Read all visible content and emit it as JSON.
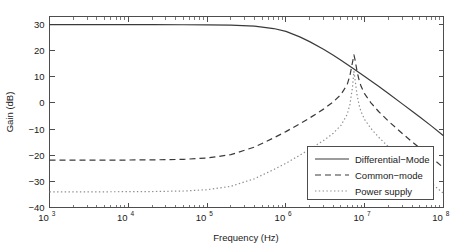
{
  "chart_data": {
    "type": "line",
    "title": "",
    "xlabel": "Frequency (Hz)",
    "ylabel": "Gain (dB)",
    "xscale": "log",
    "yscale": "linear",
    "xlim": [
      1000,
      100000000
    ],
    "ylim": [
      -40,
      33
    ],
    "grid": false,
    "legend_position": "center-right",
    "xticks": [
      {
        "value": 1000,
        "label": "10",
        "exp": "3"
      },
      {
        "value": 10000,
        "label": "10",
        "exp": "4"
      },
      {
        "value": 100000,
        "label": "10",
        "exp": "5"
      },
      {
        "value": 1000000,
        "label": "10",
        "exp": "6"
      },
      {
        "value": 10000000,
        "label": "10",
        "exp": "7"
      },
      {
        "value": 100000000,
        "label": "10",
        "exp": "8"
      }
    ],
    "yticks": [
      {
        "value": 30,
        "label": "30"
      },
      {
        "value": 20,
        "label": "20"
      },
      {
        "value": 10,
        "label": "10"
      },
      {
        "value": 0,
        "label": "0"
      },
      {
        "value": -10,
        "label": "−10"
      },
      {
        "value": -20,
        "label": "−20"
      },
      {
        "value": -30,
        "label": "−30"
      },
      {
        "value": -40,
        "label": "−40"
      }
    ],
    "series": [
      {
        "name": "Differential−Mode",
        "style": "solid",
        "color": "#3a3a3a",
        "points": [
          [
            1000,
            29.9
          ],
          [
            2000,
            29.9
          ],
          [
            5000,
            29.9
          ],
          [
            10000,
            29.9
          ],
          [
            20000,
            29.9
          ],
          [
            50000,
            29.85
          ],
          [
            100000,
            29.8
          ],
          [
            200000,
            29.7
          ],
          [
            400000,
            29.3
          ],
          [
            700000,
            28.4
          ],
          [
            1000000,
            27.3
          ],
          [
            1500000,
            25.2
          ],
          [
            2000000,
            23.4
          ],
          [
            3000000,
            20.5
          ],
          [
            4000000,
            18.2
          ],
          [
            5000000,
            16.3
          ],
          [
            7000000,
            13.3
          ],
          [
            10000000,
            10.1
          ],
          [
            15000000,
            6.3
          ],
          [
            20000000,
            3.6
          ],
          [
            30000000,
            -0.4
          ],
          [
            40000000,
            -3.2
          ],
          [
            50000000,
            -5.4
          ],
          [
            70000000,
            -8.8
          ],
          [
            100000000,
            -12.6
          ]
        ]
      },
      {
        "name": "Common−mode",
        "style": "dashed",
        "color": "#3a3a3a",
        "points": [
          [
            1000,
            -21.9
          ],
          [
            2000,
            -21.9
          ],
          [
            5000,
            -21.9
          ],
          [
            10000,
            -21.85
          ],
          [
            20000,
            -21.8
          ],
          [
            50000,
            -21.6
          ],
          [
            100000,
            -21.1
          ],
          [
            200000,
            -19.8
          ],
          [
            400000,
            -16.9
          ],
          [
            700000,
            -13.4
          ],
          [
            1000000,
            -11.0
          ],
          [
            1500000,
            -8.0
          ],
          [
            2000000,
            -5.8
          ],
          [
            3000000,
            -2.4
          ],
          [
            4000000,
            0.4
          ],
          [
            5000000,
            3.2
          ],
          [
            6000000,
            7.0
          ],
          [
            6500000,
            10.5
          ],
          [
            7000000,
            15.5
          ],
          [
            7300000,
            18.3
          ],
          [
            7600000,
            16.0
          ],
          [
            8000000,
            12.0
          ],
          [
            8500000,
            8.6
          ],
          [
            9000000,
            6.3
          ],
          [
            10000000,
            3.4
          ],
          [
            12000000,
            0.0
          ],
          [
            15000000,
            -3.3
          ],
          [
            20000000,
            -7.0
          ],
          [
            30000000,
            -11.7
          ],
          [
            40000000,
            -14.9
          ],
          [
            50000000,
            -17.3
          ],
          [
            70000000,
            -20.9
          ],
          [
            100000000,
            -24.8
          ]
        ]
      },
      {
        "name": "Power supply",
        "style": "dotted",
        "color": "#8e8e8e",
        "points": [
          [
            1000,
            -34.0
          ],
          [
            2000,
            -34.0
          ],
          [
            5000,
            -34.0
          ],
          [
            10000,
            -33.95
          ],
          [
            20000,
            -33.9
          ],
          [
            50000,
            -33.7
          ],
          [
            100000,
            -33.2
          ],
          [
            200000,
            -31.9
          ],
          [
            400000,
            -29.0
          ],
          [
            700000,
            -25.5
          ],
          [
            1000000,
            -23.1
          ],
          [
            1500000,
            -20.0
          ],
          [
            2000000,
            -17.8
          ],
          [
            3000000,
            -14.4
          ],
          [
            4000000,
            -11.6
          ],
          [
            5000000,
            -8.6
          ],
          [
            6000000,
            -4.4
          ],
          [
            6500000,
            -0.5
          ],
          [
            7000000,
            6.0
          ],
          [
            7300000,
            12.0
          ],
          [
            7500000,
            9.5
          ],
          [
            8000000,
            3.0
          ],
          [
            8500000,
            -0.9
          ],
          [
            9000000,
            -3.4
          ],
          [
            10000000,
            -6.4
          ],
          [
            12000000,
            -9.8
          ],
          [
            15000000,
            -13.1
          ],
          [
            20000000,
            -16.8
          ],
          [
            30000000,
            -21.5
          ],
          [
            40000000,
            -24.7
          ],
          [
            50000000,
            -27.1
          ],
          [
            70000000,
            -30.7
          ],
          [
            100000000,
            -34.6
          ]
        ]
      }
    ],
    "legend_entries": [
      {
        "label": "Differential−Mode",
        "style": "solid"
      },
      {
        "label": "Common−mode",
        "style": "dashed"
      },
      {
        "label": "Power supply",
        "style": "dotted"
      }
    ]
  }
}
